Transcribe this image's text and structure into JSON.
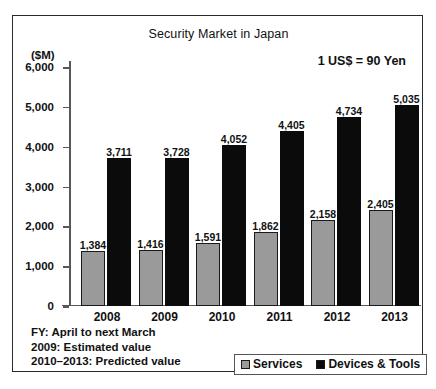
{
  "chart_data": {
    "type": "bar",
    "title": "Security Market in Japan",
    "ylabel": "($M)",
    "xlabel": "",
    "categories": [
      "2008",
      "2009",
      "2010",
      "2011",
      "2012",
      "2013"
    ],
    "series": [
      {
        "name": "Services",
        "color": "#9a9a9a",
        "values": [
          1384,
          1416,
          1591,
          1862,
          2158,
          2405
        ],
        "value_labels": [
          "1,384",
          "1,416",
          "1,591",
          "1,862",
          "2,158",
          "2,405"
        ]
      },
      {
        "name": "Devices & Tools",
        "color": "#0b0b0b",
        "values": [
          3711,
          3728,
          4052,
          4405,
          4734,
          5035
        ],
        "value_labels": [
          "3,711",
          "3,728",
          "4,052",
          "4,405",
          "4,734",
          "5,035"
        ]
      }
    ],
    "ylim": [
      0,
      6000
    ],
    "ytick_values": [
      0,
      1000,
      2000,
      3000,
      4000,
      5000,
      6000
    ],
    "ytick_labels": [
      "0",
      "1,000",
      "2,000",
      "3,000",
      "4,000",
      "5,000",
      "6,000"
    ],
    "grid": false,
    "legend_position": "bottom-right",
    "annotations": [
      "1 US$ = 90 Yen"
    ]
  },
  "chart": {
    "title": "Security Market in Japan",
    "y_axis_unit": "($M)",
    "exchange_rate_note": "1 US$ = 90 Yen"
  },
  "footnotes": [
    "FY: April to next March",
    "2009: Estimated value",
    "2010–2013: Predicted value"
  ],
  "legend": {
    "items": [
      {
        "label": "Services",
        "color": "#9a9a9a"
      },
      {
        "label": "Devices & Tools",
        "color": "#0b0b0b"
      }
    ]
  }
}
